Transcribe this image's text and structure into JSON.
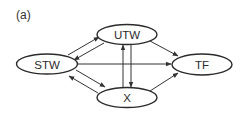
{
  "figure": {
    "panel_label": "(a)"
  },
  "nodes": {
    "utw": {
      "label": "UTW",
      "cx": 127,
      "cy": 34.5,
      "rx": 30,
      "ry": 10
    },
    "stw": {
      "label": "STW",
      "cx": 47,
      "cy": 64,
      "rx": 30.5,
      "ry": 10
    },
    "tf": {
      "label": "TF",
      "cx": 202,
      "cy": 64.5,
      "rx": 30,
      "ry": 10.5
    },
    "x": {
      "label": "X",
      "cx": 127,
      "cy": 97.5,
      "rx": 30,
      "ry": 10
    }
  },
  "edges": [
    {
      "from": "STW",
      "to": "UTW"
    },
    {
      "from": "UTW",
      "to": "STW"
    },
    {
      "from": "STW",
      "to": "X"
    },
    {
      "from": "X",
      "to": "STW"
    },
    {
      "from": "X",
      "to": "UTW"
    },
    {
      "from": "UTW",
      "to": "X"
    },
    {
      "from": "STW",
      "to": "TF"
    },
    {
      "from": "UTW",
      "to": "TF"
    },
    {
      "from": "X",
      "to": "TF"
    }
  ],
  "colors": {
    "stroke": "#2a2a2a",
    "background": "#ffffff"
  }
}
